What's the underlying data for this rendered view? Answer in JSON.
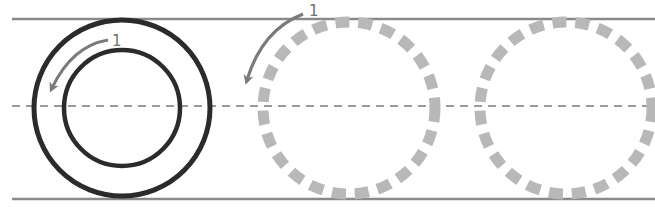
{
  "diagram": {
    "colors": {
      "guide_line": "#8a8a8a",
      "center_line": "#9a9a9a",
      "solid_circle": "#2b2b2b",
      "dashed_circle": "#b8b8b8",
      "arrow": "#7a7a7a",
      "label": "#6e6e6e",
      "background": "#ffffff"
    },
    "guides": {
      "top_y": 19,
      "bottom_y": 199,
      "center_y": 106,
      "x_start": 12,
      "x_end": 655
    },
    "circles": {
      "solid_outer": {
        "cx": 122,
        "cy": 108,
        "r": 88
      },
      "solid_inner": {
        "cx": 122,
        "cy": 108,
        "r": 58
      },
      "ghost_1": {
        "cx": 349,
        "cy": 108,
        "r": 86
      },
      "ghost_2": {
        "cx": 566,
        "cy": 108,
        "r": 86
      }
    },
    "arrows": [
      {
        "label": "1",
        "position": "inside ring, counter-clockwise"
      },
      {
        "label": "1",
        "position": "above first ghost circle, counter-clockwise"
      }
    ]
  }
}
